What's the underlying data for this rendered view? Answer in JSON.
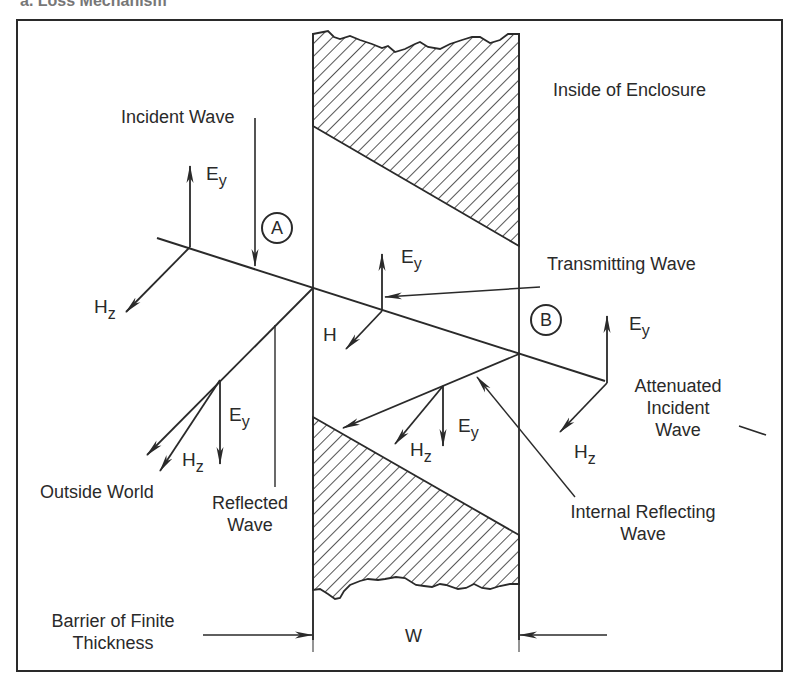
{
  "header_partial_text": "a. Loss Mechanism",
  "labels": {
    "incident_wave": "Incident Wave",
    "inside_enclosure": "Inside of Enclosure",
    "transmitting_wave": "Transmitting Wave",
    "attenuated_line1": "Attenuated",
    "attenuated_line2": "Incident",
    "attenuated_line3": "Wave",
    "outside_world": "Outside World",
    "reflected_line1": "Reflected",
    "reflected_line2": "Wave",
    "internal_line1": "Internal Reflecting",
    "internal_line2": "Wave",
    "barrier_line1": "Barrier of Finite",
    "barrier_line2": "Thickness",
    "width": "W"
  },
  "points": {
    "a": "A",
    "b": "B"
  },
  "symbols": {
    "E": "E",
    "H": "H",
    "y": "y",
    "z": "z"
  },
  "colors": {
    "ink": "#2a2a2a",
    "background": "#ffffff"
  }
}
